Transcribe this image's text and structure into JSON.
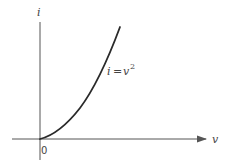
{
  "figure": {
    "y_axis_label": "i",
    "x_axis_label": "v",
    "origin_label": "0",
    "curve_label": {
      "lhs": "i",
      "eq": "=",
      "rhs_base": "v",
      "rhs_exp": "2"
    }
  },
  "colors": {
    "axis": "#555555",
    "curve": "#2a2a2a",
    "text": "#444444"
  }
}
